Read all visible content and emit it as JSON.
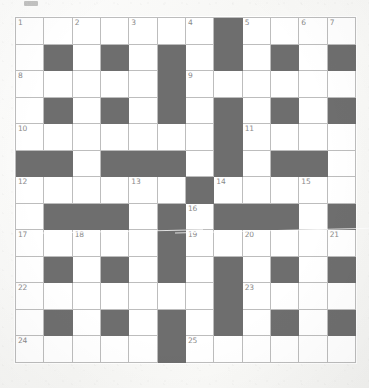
{
  "puzzle": {
    "type": "crossword-grid",
    "columns": 12,
    "rows": 13,
    "colors": {
      "block": "#6e6e6e",
      "cell": "#ffffff",
      "gridline": "#bdbdbd",
      "number_text": "#8a8a8a",
      "paper": "#fbfbfa"
    },
    "legend": {
      "white_cell": "open letter cell",
      "black_cell": "blocked cell"
    },
    "cells": [
      [
        {
          "black": false,
          "num": "1"
        },
        {
          "black": false,
          "num": ""
        },
        {
          "black": false,
          "num": "2"
        },
        {
          "black": false,
          "num": ""
        },
        {
          "black": false,
          "num": "3"
        },
        {
          "black": false,
          "num": ""
        },
        {
          "black": false,
          "num": "4"
        },
        {
          "black": true,
          "num": ""
        },
        {
          "black": false,
          "num": "5"
        },
        {
          "black": false,
          "num": ""
        },
        {
          "black": false,
          "num": "6"
        },
        {
          "black": false,
          "num": "7"
        }
      ],
      [
        {
          "black": false,
          "num": ""
        },
        {
          "black": true,
          "num": ""
        },
        {
          "black": false,
          "num": ""
        },
        {
          "black": true,
          "num": ""
        },
        {
          "black": false,
          "num": ""
        },
        {
          "black": true,
          "num": ""
        },
        {
          "black": false,
          "num": ""
        },
        {
          "black": true,
          "num": ""
        },
        {
          "black": false,
          "num": ""
        },
        {
          "black": true,
          "num": ""
        },
        {
          "black": false,
          "num": ""
        },
        {
          "black": true,
          "num": ""
        }
      ],
      [
        {
          "black": false,
          "num": "8"
        },
        {
          "black": false,
          "num": ""
        },
        {
          "black": false,
          "num": ""
        },
        {
          "black": false,
          "num": ""
        },
        {
          "black": false,
          "num": ""
        },
        {
          "black": true,
          "num": ""
        },
        {
          "black": false,
          "num": "9"
        },
        {
          "black": false,
          "num": ""
        },
        {
          "black": false,
          "num": ""
        },
        {
          "black": false,
          "num": ""
        },
        {
          "black": false,
          "num": ""
        },
        {
          "black": false,
          "num": ""
        }
      ],
      [
        {
          "black": false,
          "num": ""
        },
        {
          "black": true,
          "num": ""
        },
        {
          "black": false,
          "num": ""
        },
        {
          "black": true,
          "num": ""
        },
        {
          "black": false,
          "num": ""
        },
        {
          "black": true,
          "num": ""
        },
        {
          "black": false,
          "num": ""
        },
        {
          "black": true,
          "num": ""
        },
        {
          "black": false,
          "num": ""
        },
        {
          "black": true,
          "num": ""
        },
        {
          "black": false,
          "num": ""
        },
        {
          "black": true,
          "num": ""
        }
      ],
      [
        {
          "black": false,
          "num": "10"
        },
        {
          "black": false,
          "num": ""
        },
        {
          "black": false,
          "num": ""
        },
        {
          "black": false,
          "num": ""
        },
        {
          "black": false,
          "num": ""
        },
        {
          "black": false,
          "num": ""
        },
        {
          "black": false,
          "num": ""
        },
        {
          "black": true,
          "num": ""
        },
        {
          "black": false,
          "num": "11"
        },
        {
          "black": false,
          "num": ""
        },
        {
          "black": false,
          "num": ""
        },
        {
          "black": false,
          "num": ""
        }
      ],
      [
        {
          "black": true,
          "num": ""
        },
        {
          "black": true,
          "num": ""
        },
        {
          "black": false,
          "num": ""
        },
        {
          "black": true,
          "num": ""
        },
        {
          "black": true,
          "num": ""
        },
        {
          "black": true,
          "num": ""
        },
        {
          "black": false,
          "num": ""
        },
        {
          "black": true,
          "num": ""
        },
        {
          "black": false,
          "num": ""
        },
        {
          "black": true,
          "num": ""
        },
        {
          "black": true,
          "num": ""
        },
        {
          "black": false,
          "num": ""
        }
      ],
      [
        {
          "black": false,
          "num": "12"
        },
        {
          "black": false,
          "num": ""
        },
        {
          "black": false,
          "num": ""
        },
        {
          "black": false,
          "num": ""
        },
        {
          "black": false,
          "num": "13"
        },
        {
          "black": false,
          "num": ""
        },
        {
          "black": true,
          "num": ""
        },
        {
          "black": false,
          "num": "14"
        },
        {
          "black": false,
          "num": ""
        },
        {
          "black": false,
          "num": ""
        },
        {
          "black": false,
          "num": "15"
        },
        {
          "black": false,
          "num": ""
        }
      ],
      [
        {
          "black": false,
          "num": ""
        },
        {
          "black": true,
          "num": ""
        },
        {
          "black": true,
          "num": ""
        },
        {
          "black": true,
          "num": ""
        },
        {
          "black": false,
          "num": ""
        },
        {
          "black": true,
          "num": ""
        },
        {
          "black": false,
          "num": "16"
        },
        {
          "black": true,
          "num": ""
        },
        {
          "black": true,
          "num": ""
        },
        {
          "black": true,
          "num": ""
        },
        {
          "black": false,
          "num": ""
        },
        {
          "black": true,
          "num": ""
        }
      ],
      [
        {
          "black": false,
          "num": "17"
        },
        {
          "black": false,
          "num": ""
        },
        {
          "black": false,
          "num": "18"
        },
        {
          "black": false,
          "num": ""
        },
        {
          "black": false,
          "num": ""
        },
        {
          "black": true,
          "num": ""
        },
        {
          "black": false,
          "num": "19"
        },
        {
          "black": false,
          "num": ""
        },
        {
          "black": false,
          "num": "20"
        },
        {
          "black": false,
          "num": ""
        },
        {
          "black": false,
          "num": ""
        },
        {
          "black": false,
          "num": "21"
        }
      ],
      [
        {
          "black": false,
          "num": ""
        },
        {
          "black": true,
          "num": ""
        },
        {
          "black": false,
          "num": ""
        },
        {
          "black": true,
          "num": ""
        },
        {
          "black": false,
          "num": ""
        },
        {
          "black": true,
          "num": ""
        },
        {
          "black": false,
          "num": ""
        },
        {
          "black": true,
          "num": ""
        },
        {
          "black": false,
          "num": ""
        },
        {
          "black": true,
          "num": ""
        },
        {
          "black": false,
          "num": ""
        },
        {
          "black": true,
          "num": ""
        }
      ],
      [
        {
          "black": false,
          "num": "22"
        },
        {
          "black": false,
          "num": ""
        },
        {
          "black": false,
          "num": ""
        },
        {
          "black": false,
          "num": ""
        },
        {
          "black": false,
          "num": ""
        },
        {
          "black": false,
          "num": ""
        },
        {
          "black": false,
          "num": ""
        },
        {
          "black": true,
          "num": ""
        },
        {
          "black": false,
          "num": "23"
        },
        {
          "black": false,
          "num": ""
        },
        {
          "black": false,
          "num": ""
        },
        {
          "black": false,
          "num": ""
        }
      ],
      [
        {
          "black": false,
          "num": ""
        },
        {
          "black": true,
          "num": ""
        },
        {
          "black": false,
          "num": ""
        },
        {
          "black": true,
          "num": ""
        },
        {
          "black": false,
          "num": ""
        },
        {
          "black": true,
          "num": ""
        },
        {
          "black": false,
          "num": ""
        },
        {
          "black": true,
          "num": ""
        },
        {
          "black": false,
          "num": ""
        },
        {
          "black": true,
          "num": ""
        },
        {
          "black": false,
          "num": ""
        },
        {
          "black": true,
          "num": ""
        }
      ],
      [
        {
          "black": false,
          "num": "24"
        },
        {
          "black": false,
          "num": ""
        },
        {
          "black": false,
          "num": ""
        },
        {
          "black": false,
          "num": ""
        },
        {
          "black": false,
          "num": ""
        },
        {
          "black": true,
          "num": ""
        },
        {
          "black": false,
          "num": "25"
        },
        {
          "black": false,
          "num": ""
        },
        {
          "black": false,
          "num": ""
        },
        {
          "black": false,
          "num": ""
        },
        {
          "black": false,
          "num": ""
        },
        {
          "black": false,
          "num": ""
        }
      ]
    ],
    "clue_numbers": [
      "1",
      "2",
      "3",
      "4",
      "5",
      "6",
      "7",
      "8",
      "9",
      "10",
      "11",
      "12",
      "13",
      "14",
      "15",
      "16",
      "17",
      "18",
      "19",
      "20",
      "21",
      "22",
      "23",
      "24",
      "25"
    ]
  }
}
